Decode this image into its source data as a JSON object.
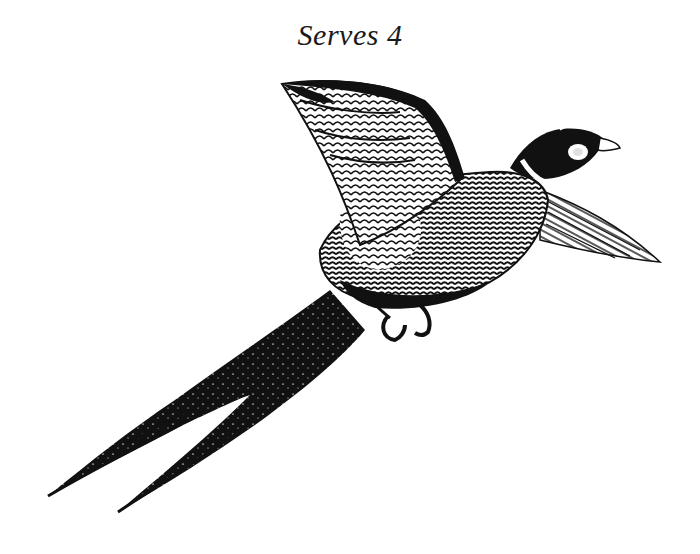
{
  "caption": {
    "text": "Serves 4"
  },
  "illustration": {
    "subject": "pheasant-in-flight",
    "style": "black-and-white engraving",
    "ink_color": "#111111",
    "paper_color": "#ffffff"
  }
}
